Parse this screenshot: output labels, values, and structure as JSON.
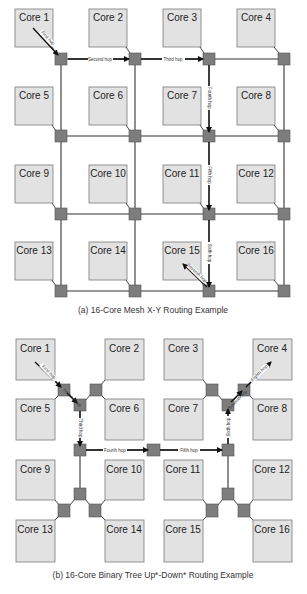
{
  "mesh": {
    "caption": "(a) 16-Core Mesh X-Y Routing Example",
    "cores": [
      "Core 1",
      "Core 2",
      "Core 3",
      "Core 4",
      "Core 5",
      "Core 6",
      "Core 7",
      "Core 8",
      "Core 9",
      "Core 10",
      "Core 11",
      "Core 12",
      "Core 13",
      "Core 14",
      "Core 15",
      "Core 16"
    ],
    "hops": {
      "first": "First hop",
      "second": "Second hop",
      "third": "Third hop",
      "fourth": "Fourth hop",
      "fifth": "Fifth hop",
      "sixth": "Sixth hop",
      "seventh": "Seventh hop"
    }
  },
  "tree": {
    "caption": "(b) 16-Core Binary Tree Up*-Down* Routing Example",
    "cores": [
      "Core 1",
      "Core 2",
      "Core 3",
      "Core 4",
      "Core 5",
      "Core 6",
      "Core 7",
      "Core 8",
      "Core 9",
      "Core 10",
      "Core 11",
      "Core 12",
      "Core 13",
      "Core 14",
      "Core 15",
      "Core 16"
    ],
    "hops": {
      "first": "First hop",
      "second": "Second hop",
      "third": "Third hop",
      "fourth": "Fourth hop",
      "fifth": "Fifth hop",
      "sixth": "Sixth hop",
      "seventh": "Seventh hop",
      "eighth": "Eighth hop"
    }
  },
  "colors": {
    "core_fill": "#e2e2e2",
    "router_fill": "#7d7d7d",
    "link": "#333333"
  }
}
